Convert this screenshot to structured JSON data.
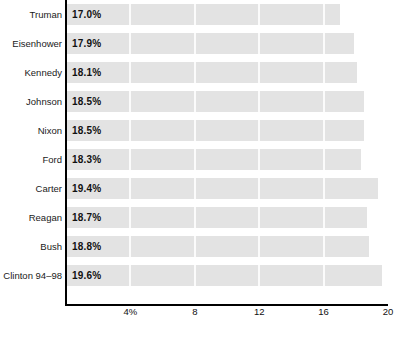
{
  "chart_data": {
    "type": "bar",
    "orientation": "horizontal",
    "title": "",
    "subtitle": "",
    "xlabel": "",
    "ylabel": "",
    "categories": [
      "Truman",
      "Eisenhower",
      "Kennedy",
      "Johnson",
      "Nixon",
      "Ford",
      "Carter",
      "Reagan",
      "Bush",
      "Clinton 94–98"
    ],
    "values": [
      17.0,
      17.9,
      18.1,
      18.5,
      18.5,
      18.3,
      19.4,
      18.7,
      18.8,
      19.6
    ],
    "data_labels": [
      "17.0%",
      "17.9%",
      "18.1%",
      "18.5%",
      "18.5%",
      "18.3%",
      "19.4%",
      "18.7%",
      "18.8%",
      "19.6%"
    ],
    "xlim": [
      0,
      20
    ],
    "xticks": [
      4,
      8,
      12,
      16,
      20
    ],
    "xtick_labels": [
      "4%",
      "8",
      "12",
      "16",
      "20"
    ],
    "grid": true,
    "grid_axis": "x",
    "legend": null,
    "bar_color": "#e3e3e3",
    "axis_color": "#000000",
    "label_color": "#1a1a1a"
  },
  "axis": {
    "ticks": [
      {
        "label": "4%",
        "value": 4
      },
      {
        "label": "8",
        "value": 8
      },
      {
        "label": "12",
        "value": 12
      },
      {
        "label": "16",
        "value": 16
      },
      {
        "label": "20",
        "value": 20
      }
    ]
  },
  "footer": {
    "source_text": ""
  }
}
